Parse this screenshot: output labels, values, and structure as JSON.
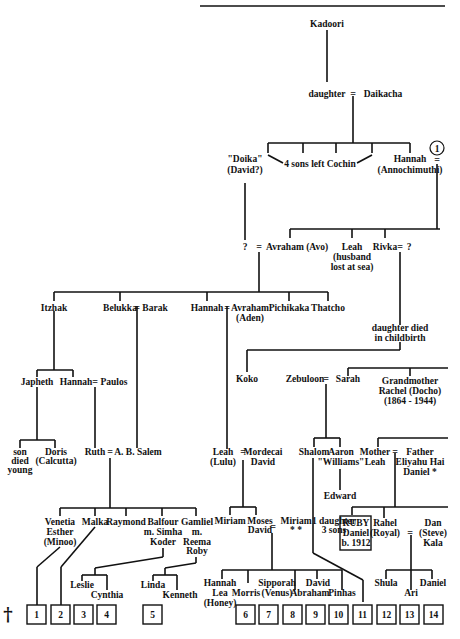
{
  "tree": {
    "root": "Kadoori",
    "gen1": {
      "left": "daughter",
      "right": "Daikacha",
      "marriage": "="
    },
    "gen2": {
      "doika": [
        "\"Doika\"",
        "(David?)"
      ],
      "sons": "4 sons left Cochin",
      "hannah": [
        "Hannah",
        "(Annochimuthi)"
      ],
      "marker": "1"
    },
    "gen3": {
      "unknown": "?",
      "avraham": "Avraham (Avo)",
      "leah": [
        "Leah",
        "(husband",
        "lost at sea)"
      ],
      "rivka": "Rivka",
      "rivka_spouse": "?",
      "daughter_died": [
        "daughter died",
        "in childbirth"
      ]
    },
    "gen4": {
      "itzhak": "Itzhak",
      "belukka": "Belukka",
      "barak": "Barak",
      "hannah": "Hannah",
      "avraham_aden": [
        "Avraham",
        "(Aden)"
      ],
      "pichikaka": "Pichikaka",
      "thatcho": "Thatcho",
      "koko": "Koko",
      "zebuloon": "Zebuloon",
      "sarah": "Sarah",
      "grandmother": [
        "Grandmother",
        "Rachel (Docho)",
        "(1864 - 1944)"
      ]
    },
    "gen5": {
      "japheth": "Japheth",
      "hannah": "Hannah",
      "paulos": "Paulos",
      "son_died": [
        "son",
        "died",
        "young"
      ],
      "doris": [
        "Doris",
        "(Calcutta)"
      ],
      "ruth": "Ruth",
      "ab_salem": "A. B. Salem",
      "leah_lulu": [
        "Leah",
        "(Lulu)"
      ],
      "mordecai": [
        "Mordecai",
        "David"
      ],
      "shalom": "Shalom",
      "aaron": [
        "Aaron",
        "\"Williams\""
      ],
      "edward": "Edward",
      "mother_leah": [
        "Mother",
        "Leah"
      ],
      "father": [
        "Father",
        "Eliyahu Hai",
        "Daniel *"
      ]
    },
    "gen6": {
      "venetia": [
        "Venetia",
        "Esther",
        "(Minoo)"
      ],
      "malka": "Malka",
      "raymond": "Raymond",
      "balfour": [
        "Balfour",
        "m. Simha",
        "Koder"
      ],
      "gamliel": [
        "Gamliel",
        "m.",
        "Reema",
        "Roby"
      ],
      "miriam": "Miriam",
      "moses": [
        "Moses",
        "David"
      ],
      "miriam2": [
        "Miriam",
        "* *"
      ],
      "one_daughter": [
        "1 daughter",
        "3 sons"
      ],
      "ruby": [
        "RUBY",
        "Daniel",
        "b. 1912"
      ],
      "rahel": [
        "Rahel",
        "(Royal)"
      ],
      "dan": [
        "Dan",
        "(Steve)",
        "Kala"
      ]
    },
    "gen7": {
      "leslie": "Leslie",
      "cynthia": "Cynthia",
      "linda": "Linda",
      "kenneth": "Kenneth",
      "hannah_lea": [
        "Hannah",
        "Lea",
        "(Honey)"
      ],
      "morris": "Morris",
      "sipporah": [
        "Sipporah",
        "(Venus)"
      ],
      "david": "David",
      "abraham": "Abraham",
      "pinhas": "Pinhas",
      "shula": "Shula",
      "ari": "Ari",
      "daniel": "Daniel"
    },
    "dagger": "†",
    "boxes": [
      "1",
      "2",
      "3",
      "4",
      "5",
      "6",
      "7",
      "8",
      "9",
      "10",
      "11",
      "12",
      "13",
      "14"
    ]
  }
}
